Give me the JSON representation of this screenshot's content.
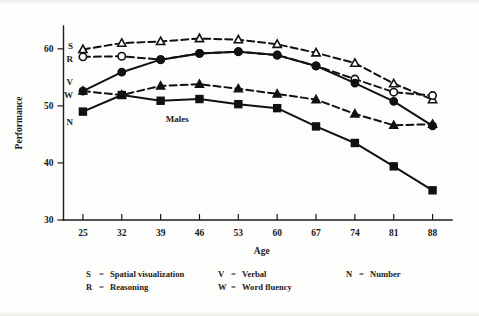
{
  "figure": {
    "annotation": "Males",
    "background_color": "#fdfdfc",
    "ink_color": "#111111"
  },
  "legend": {
    "rows": [
      [
        {
          "key": "S",
          "eq": "=",
          "desc": "Spatial visualization"
        },
        {
          "key": "V",
          "eq": "=",
          "desc": "Verbal"
        },
        {
          "key": "N",
          "eq": "=",
          "desc": "Number"
        }
      ],
      [
        {
          "key": "R",
          "eq": "=",
          "desc": "Reasoning"
        },
        {
          "key": "W",
          "eq": "=",
          "desc": "Word fluency"
        }
      ]
    ]
  },
  "chart_data": {
    "type": "line",
    "title": "",
    "annotation": "Males",
    "xlabel": "Age",
    "ylabel": "Performance",
    "grid": false,
    "legend_position": "below-plot",
    "x": [
      25,
      32,
      39,
      46,
      53,
      60,
      67,
      74,
      81,
      88
    ],
    "categories": [
      "25",
      "32",
      "39",
      "46",
      "53",
      "60",
      "67",
      "74",
      "81",
      "88"
    ],
    "xlim": [
      21.5,
      91.5
    ],
    "ylim": [
      30,
      64
    ],
    "yticks": [
      30,
      40,
      50,
      60
    ],
    "ytick_labels": [
      "30",
      "40",
      "50",
      "60"
    ],
    "xticks": [
      25,
      32,
      39,
      46,
      53,
      60,
      67,
      74,
      81,
      88
    ],
    "series": [
      {
        "name": "S",
        "label": "Spatial visualization",
        "tag": "S",
        "marker": "open-triangle",
        "line_style": "dashed",
        "values": [
          59.9,
          61.0,
          61.3,
          61.8,
          61.6,
          60.8,
          59.3,
          57.5,
          53.9,
          51.1
        ]
      },
      {
        "name": "R",
        "label": "Reasoning",
        "tag": "R",
        "marker": "open-circle",
        "line_style": "dashed",
        "values": [
          58.6,
          58.7,
          58.1,
          59.2,
          59.5,
          58.9,
          57.0,
          54.7,
          52.4,
          51.8
        ]
      },
      {
        "name": "V",
        "label": "Verbal",
        "tag": "V",
        "marker": "filled-triangle",
        "line_style": "dashed",
        "values": [
          52.6,
          51.9,
          53.5,
          53.8,
          53.0,
          52.1,
          51.1,
          48.6,
          46.6,
          46.8
        ]
      },
      {
        "name": "W",
        "label": "Word fluency",
        "tag": "W",
        "marker": "filled-circle",
        "line_style": "solid",
        "values": [
          52.6,
          55.9,
          58.1,
          59.2,
          59.5,
          58.9,
          57.0,
          54.0,
          50.8,
          46.5
        ]
      },
      {
        "name": "N",
        "label": "Number",
        "tag": "N",
        "marker": "filled-square",
        "line_style": "solid",
        "values": [
          49.0,
          51.9,
          50.9,
          51.2,
          50.3,
          49.6,
          46.4,
          43.5,
          39.4,
          35.2
        ]
      }
    ],
    "series_tags": [
      {
        "tag": "S",
        "at_x": 25,
        "at_y": 60.6
      },
      {
        "tag": "R",
        "at_x": 25,
        "at_y": 58.3
      },
      {
        "tag": "V",
        "at_x": 25,
        "at_y": 54.2
      },
      {
        "tag": "W",
        "at_x": 25,
        "at_y": 52.0
      },
      {
        "tag": "N",
        "at_x": 25,
        "at_y": 47.2
      }
    ]
  }
}
